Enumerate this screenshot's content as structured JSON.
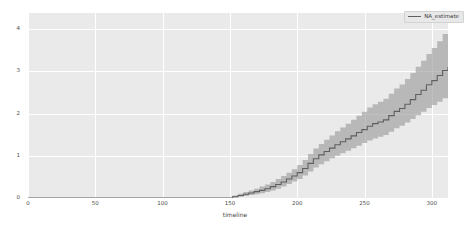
{
  "chart_data": {
    "type": "line",
    "title": "",
    "xlabel": "timeline",
    "ylabel": "",
    "xlim": [
      0,
      312
    ],
    "ylim": [
      0,
      4.38
    ],
    "xticks": [
      0,
      50,
      100,
      150,
      200,
      250,
      300
    ],
    "xticklabels": [
      "0",
      "50",
      "100",
      "150",
      "200",
      "250",
      "300"
    ],
    "yticks": [
      0,
      1,
      2,
      3,
      4
    ],
    "yticklabels": [
      "0",
      "1",
      "2",
      "3",
      "4"
    ],
    "grid": true,
    "legend_position": "upper right",
    "legend": [
      "NA_estimate"
    ],
    "series": [
      {
        "name": "NA_estimate",
        "drawstyle": "steps-post",
        "color": "#5f5f5f",
        "x": [
          0,
          10,
          20,
          30,
          40,
          50,
          60,
          70,
          80,
          90,
          100,
          110,
          120,
          130,
          140,
          148,
          152,
          156,
          160,
          164,
          168,
          172,
          176,
          180,
          184,
          188,
          192,
          196,
          200,
          204,
          208,
          212,
          216,
          220,
          224,
          228,
          232,
          236,
          240,
          244,
          248,
          252,
          256,
          260,
          264,
          268,
          272,
          276,
          280,
          284,
          288,
          292,
          296,
          300,
          304,
          308,
          312
        ],
        "values": [
          0.0,
          0.0,
          0.0,
          0.0,
          0.0,
          0.0,
          0.0,
          0.0,
          0.0,
          0.0,
          0.0,
          0.0,
          0.0,
          0.0,
          0.0,
          0.0,
          0.03,
          0.06,
          0.09,
          0.12,
          0.15,
          0.18,
          0.22,
          0.27,
          0.32,
          0.38,
          0.45,
          0.52,
          0.6,
          0.7,
          0.82,
          0.93,
          1.02,
          1.1,
          1.18,
          1.26,
          1.33,
          1.4,
          1.47,
          1.55,
          1.62,
          1.7,
          1.76,
          1.8,
          1.85,
          1.95,
          2.05,
          2.12,
          2.22,
          2.33,
          2.45,
          2.55,
          2.68,
          2.78,
          2.9,
          3.02,
          3.1
        ]
      }
    ],
    "confidence_band": {
      "color": "#9a9a9a",
      "opacity": 0.62,
      "lower": [
        0.0,
        0.0,
        0.0,
        0.0,
        0.0,
        0.0,
        0.0,
        0.0,
        0.0,
        0.0,
        0.0,
        0.0,
        0.0,
        0.0,
        0.0,
        0.0,
        0.01,
        0.03,
        0.05,
        0.07,
        0.09,
        0.11,
        0.14,
        0.18,
        0.22,
        0.27,
        0.33,
        0.39,
        0.45,
        0.53,
        0.63,
        0.72,
        0.8,
        0.87,
        0.94,
        1.0,
        1.06,
        1.12,
        1.18,
        1.24,
        1.3,
        1.36,
        1.41,
        1.45,
        1.49,
        1.57,
        1.65,
        1.71,
        1.79,
        1.87,
        1.96,
        2.04,
        2.13,
        2.2,
        2.28,
        2.36,
        2.42
      ],
      "upper": [
        0.0,
        0.0,
        0.0,
        0.0,
        0.0,
        0.0,
        0.0,
        0.0,
        0.0,
        0.0,
        0.0,
        0.0,
        0.0,
        0.0,
        0.0,
        0.0,
        0.06,
        0.1,
        0.14,
        0.18,
        0.22,
        0.27,
        0.32,
        0.38,
        0.45,
        0.52,
        0.6,
        0.68,
        0.78,
        0.9,
        1.04,
        1.17,
        1.28,
        1.38,
        1.48,
        1.58,
        1.67,
        1.76,
        1.85,
        1.95,
        2.04,
        2.14,
        2.22,
        2.28,
        2.35,
        2.47,
        2.59,
        2.69,
        2.82,
        2.96,
        3.11,
        3.25,
        3.41,
        3.55,
        3.71,
        3.88,
        4.22
      ]
    }
  }
}
